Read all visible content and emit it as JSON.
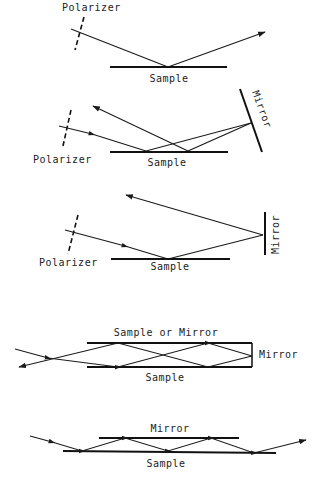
{
  "colors": {
    "background": "#ffffff",
    "ink": "#1a1a1a"
  },
  "panels": [
    {
      "id": "single-reflection",
      "labels": {
        "polarizer": "Polarizer",
        "sample": "Sample"
      }
    },
    {
      "id": "double-reflection-tilted-mirror",
      "labels": {
        "polarizer": "Polarizer",
        "sample": "Sample",
        "mirror": "Mirror"
      }
    },
    {
      "id": "retro-reflection-vertical-mirror",
      "labels": {
        "polarizer": "Polarizer",
        "sample": "Sample",
        "mirror": "Mirror"
      }
    },
    {
      "id": "multiple-reflection-cavity",
      "labels": {
        "top": "Sample or Mirror",
        "right": "Mirror",
        "bottom": "Sample"
      }
    },
    {
      "id": "multiple-reflection-parallel-mirror",
      "labels": {
        "top": "Mirror",
        "bottom": "Sample"
      }
    }
  ]
}
